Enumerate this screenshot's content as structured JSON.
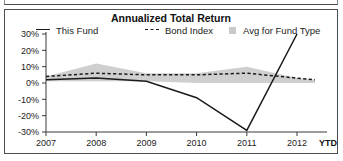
{
  "panel": {
    "title": "Annualized Total Return"
  },
  "legend": {
    "items": [
      {
        "label": "This Fund",
        "marker": "solid-line-swatch",
        "color": "#1a1a1a"
      },
      {
        "label": "Bond Index",
        "marker": "dashed-line-swatch",
        "color": "#1a1a1a"
      },
      {
        "label": "Avg for Fund Type",
        "marker": "filled-square-swatch",
        "color": "#c9c9c9"
      }
    ]
  },
  "chart_data": {
    "type": "line",
    "title": "Annualized Total Return",
    "xlabel": "",
    "ylabel": "",
    "grid": false,
    "legend_position": "top",
    "x": [
      "2007",
      "2008",
      "2009",
      "2010",
      "2011",
      "2012",
      "YTD"
    ],
    "x_tick_labels": [
      "2007",
      "2008",
      "2009",
      "2010",
      "2011",
      "2012",
      "YTD"
    ],
    "y_tick_labels": [
      "30%",
      "20%",
      "10%",
      "0%",
      "-10%",
      "-20%",
      "-30%"
    ],
    "y_ticks": [
      30,
      20,
      10,
      0,
      -10,
      -20,
      -30
    ],
    "ylim": [
      -30,
      30
    ],
    "series": [
      {
        "name": "This Fund",
        "style": "solid",
        "color": "#1a1a1a",
        "values": [
          2,
          3,
          1,
          -9,
          -29,
          30,
          null
        ]
      },
      {
        "name": "Bond Index",
        "style": "dashed",
        "color": "#1a1a1a",
        "values": [
          4,
          6,
          5,
          5,
          6,
          3,
          2
        ]
      },
      {
        "name": "Avg for Fund Type",
        "style": "band",
        "color": "#cfcfcf",
        "band_upper": [
          4,
          12,
          6,
          6,
          10,
          3,
          2
        ],
        "band_lower": [
          1,
          1,
          1,
          0,
          0,
          0,
          0
        ]
      }
    ]
  }
}
